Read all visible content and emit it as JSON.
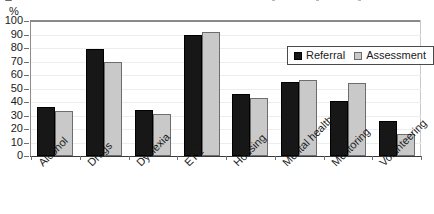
{
  "chart_data": {
    "type": "bar",
    "title": "",
    "xlabel": "",
    "ylabel": "%",
    "ylim": [
      0,
      100
    ],
    "ytick_step": 10,
    "yticks": [
      0,
      10,
      20,
      30,
      40,
      50,
      60,
      70,
      80,
      90,
      100
    ],
    "grid": true,
    "legend_position": "top-right inside plot area",
    "categories": [
      "Alcohol",
      "Drugs",
      "Dyslexia",
      "ETE",
      "Housing",
      "Mental health",
      "Mentoring",
      "Volunteering"
    ],
    "series": [
      {
        "name": "Referral",
        "color": "#171717",
        "values": [
          36,
          79,
          34,
          90,
          46,
          55,
          41,
          26
        ]
      },
      {
        "name": "Assessment",
        "color": "#c9c9c9",
        "values": [
          33,
          70,
          31,
          92,
          43,
          56,
          54,
          16
        ]
      }
    ]
  },
  "axis": {
    "unit_label": "%"
  },
  "legend": {
    "items": [
      {
        "label": "Referral",
        "swatch": "filled-black-square-icon"
      },
      {
        "label": "Assessment",
        "swatch": "filled-gray-square-icon"
      }
    ]
  }
}
